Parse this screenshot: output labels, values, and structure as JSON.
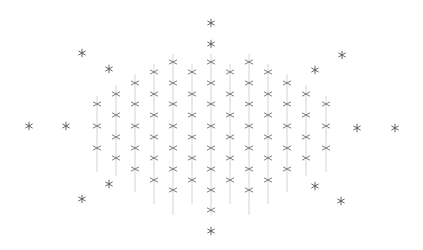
{
  "chart_data": {
    "type": "scatter",
    "title": "",
    "xlabel": "",
    "ylabel": "",
    "grid": false,
    "legend": null,
    "axes_visible": false,
    "pixel_space": {
      "width": 423,
      "height": 250
    },
    "colors": {
      "marker": "#6e6e6e",
      "stem": "#cfcfcf",
      "star": "#555555",
      "background": "#ffffff"
    },
    "series": [
      {
        "name": "grid-points",
        "marker": "x",
        "columns": [
          {
            "x": 97,
            "y": [
              104,
              126,
              148
            ],
            "stem": [
              96,
              172
            ]
          },
          {
            "x": 116,
            "y": [
              94,
              115,
              137,
              158
            ],
            "stem": [
              85,
              176
            ]
          },
          {
            "x": 135,
            "y": [
              83,
              104,
              126,
              148,
              169
            ],
            "stem": [
              74,
              192
            ]
          },
          {
            "x": 154,
            "y": [
              72,
              94,
              115,
              137,
              158,
              180
            ],
            "stem": [
              64,
              204
            ]
          },
          {
            "x": 173,
            "y": [
              62,
              83,
              104,
              126,
              148,
              169,
              190
            ],
            "stem": [
              54,
              215
            ]
          },
          {
            "x": 192,
            "y": [
              72,
              94,
              115,
              137,
              158,
              180
            ],
            "stem": [
              64,
              204
            ]
          },
          {
            "x": 211,
            "y": [
              62,
              83,
              104,
              126,
              148,
              169,
              190,
              210
            ],
            "stem": [
              54,
              215
            ]
          },
          {
            "x": 230,
            "y": [
              72,
              94,
              115,
              137,
              158,
              180
            ],
            "stem": [
              64,
              204
            ]
          },
          {
            "x": 249,
            "y": [
              62,
              83,
              104,
              126,
              148,
              169,
              190
            ],
            "stem": [
              54,
              215
            ]
          },
          {
            "x": 268,
            "y": [
              72,
              94,
              115,
              137,
              158,
              180
            ],
            "stem": [
              64,
              204
            ]
          },
          {
            "x": 287,
            "y": [
              83,
              104,
              126,
              148,
              169
            ],
            "stem": [
              74,
              192
            ]
          },
          {
            "x": 306,
            "y": [
              94,
              115,
              137,
              158
            ],
            "stem": [
              85,
              176
            ]
          },
          {
            "x": 326,
            "y": [
              104,
              126,
              148
            ],
            "stem": [
              96,
              172
            ]
          }
        ]
      },
      {
        "name": "outer-points",
        "marker": "*",
        "points": [
          {
            "x": 211,
            "y": 23
          },
          {
            "x": 211,
            "y": 44
          },
          {
            "x": 211,
            "y": 231
          },
          {
            "x": 82,
            "y": 53
          },
          {
            "x": 109,
            "y": 69
          },
          {
            "x": 29,
            "y": 126
          },
          {
            "x": 66,
            "y": 126
          },
          {
            "x": 109,
            "y": 184
          },
          {
            "x": 82,
            "y": 199
          },
          {
            "x": 342,
            "y": 55
          },
          {
            "x": 315,
            "y": 70
          },
          {
            "x": 357,
            "y": 128
          },
          {
            "x": 395,
            "y": 128
          },
          {
            "x": 315,
            "y": 186
          },
          {
            "x": 341,
            "y": 201
          }
        ]
      }
    ]
  }
}
